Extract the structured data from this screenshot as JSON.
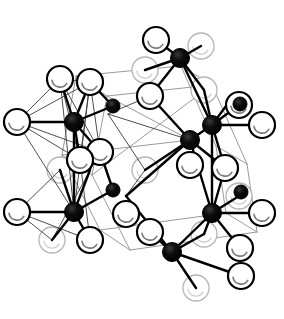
{
  "figure": {
    "background_color": "#ffffff",
    "palette": {
      "open_sphere_fill": "#ffffff",
      "open_sphere_stroke": "#000000",
      "open_sphere_highlight": "#7a7a7a",
      "faint_sphere_stroke": "#b4b4b4",
      "faint_sphere_highlight": "#cccccc",
      "filled_sphere_fill": "#000000",
      "bond_color": "#000000",
      "thin_bond_color": "#3a3a3a",
      "cell_edge_color": "#9a9a9a"
    },
    "geometry": {
      "width": 284,
      "height": 319,
      "open_radius": 13,
      "faint_radius": 13,
      "big_black_radius": 9.5,
      "small_black_radius": 7
    },
    "cell_edges": [
      [
        107,
        96,
        212,
        85
      ],
      [
        107,
        96,
        92,
        175
      ],
      [
        212,
        85,
        247,
        164
      ],
      [
        92,
        175,
        130,
        250
      ],
      [
        247,
        164,
        257,
        232
      ],
      [
        130,
        250,
        257,
        232
      ],
      [
        76,
        76,
        107,
        96
      ],
      [
        181,
        66,
        212,
        85
      ],
      [
        62,
        155,
        92,
        175
      ],
      [
        216,
        146,
        247,
        164
      ],
      [
        76,
        76,
        181,
        66
      ],
      [
        76,
        76,
        62,
        155
      ],
      [
        181,
        66,
        216,
        146
      ],
      [
        62,
        155,
        100,
        230
      ],
      [
        216,
        146,
        226,
        213
      ],
      [
        100,
        230,
        226,
        213
      ],
      [
        100,
        230,
        130,
        250
      ],
      [
        226,
        213,
        257,
        232
      ],
      [
        62,
        155,
        190,
        140
      ],
      [
        107,
        96,
        190,
        140
      ],
      [
        92,
        175,
        212,
        85
      ]
    ],
    "thin_bonds": [
      [
        17,
        122,
        60,
        79
      ],
      [
        17,
        122,
        90,
        82
      ],
      [
        17,
        122,
        80,
        160
      ],
      [
        17,
        122,
        100,
        152
      ],
      [
        60,
        79,
        90,
        82
      ],
      [
        60,
        79,
        80,
        160
      ],
      [
        60,
        79,
        100,
        152
      ],
      [
        90,
        82,
        100,
        152
      ],
      [
        90,
        82,
        80,
        160
      ],
      [
        80,
        160,
        100,
        152
      ],
      [
        60,
        79,
        74,
        212
      ],
      [
        90,
        82,
        74,
        212
      ],
      [
        17,
        122,
        74,
        212
      ],
      [
        100,
        152,
        52,
        240
      ],
      [
        80,
        160,
        90,
        240
      ],
      [
        17,
        212,
        60,
        170
      ],
      [
        17,
        212,
        52,
        240
      ],
      [
        17,
        212,
        90,
        240
      ],
      [
        100,
        152,
        74,
        122
      ],
      [
        80,
        160,
        74,
        122
      ],
      [
        108,
        114,
        190,
        140
      ],
      [
        108,
        114,
        150,
        96
      ],
      [
        150,
        96,
        190,
        140
      ],
      [
        190,
        140,
        145,
        170
      ],
      [
        145,
        170,
        108,
        114
      ],
      [
        190,
        140,
        225,
        168
      ],
      [
        126,
        196,
        190,
        140
      ],
      [
        126,
        196,
        145,
        170
      ],
      [
        156,
        40,
        180,
        58
      ],
      [
        201,
        46,
        180,
        58
      ],
      [
        150,
        96,
        180,
        58
      ],
      [
        204,
        90,
        180,
        58
      ],
      [
        241,
        276,
        172,
        252
      ],
      [
        196,
        288,
        172,
        252
      ],
      [
        150,
        232,
        172,
        252
      ],
      [
        204,
        234,
        172,
        252
      ]
    ],
    "bonds": [
      [
        74,
        122,
        17,
        122
      ],
      [
        74,
        122,
        60,
        79
      ],
      [
        74,
        122,
        90,
        82
      ],
      [
        74,
        122,
        100,
        152
      ],
      [
        74,
        122,
        80,
        160
      ],
      [
        74,
        122,
        113,
        106
      ],
      [
        74,
        122,
        74,
        212
      ],
      [
        74,
        212,
        17,
        212
      ],
      [
        74,
        212,
        60,
        170
      ],
      [
        74,
        212,
        90,
        170
      ],
      [
        74,
        212,
        52,
        240
      ],
      [
        74,
        212,
        90,
        240
      ],
      [
        74,
        212,
        113,
        190
      ],
      [
        180,
        58,
        156,
        40
      ],
      [
        180,
        58,
        201,
        46
      ],
      [
        180,
        58,
        150,
        96
      ],
      [
        180,
        58,
        204,
        90
      ],
      [
        180,
        58,
        145,
        70
      ],
      [
        180,
        58,
        212,
        125
      ],
      [
        212,
        125,
        204,
        90
      ],
      [
        212,
        125,
        239,
        105
      ],
      [
        212,
        125,
        262,
        125
      ],
      [
        212,
        125,
        190,
        140
      ],
      [
        212,
        125,
        225,
        168
      ],
      [
        212,
        125,
        226,
        106
      ],
      [
        212,
        125,
        212,
        213
      ],
      [
        212,
        213,
        262,
        213
      ],
      [
        212,
        213,
        190,
        140
      ],
      [
        212,
        213,
        239,
        196
      ],
      [
        212,
        213,
        225,
        168
      ],
      [
        212,
        213,
        172,
        252
      ],
      [
        212,
        213,
        204,
        234
      ],
      [
        212,
        213,
        240,
        248
      ],
      [
        172,
        252,
        241,
        276
      ],
      [
        172,
        252,
        196,
        288
      ],
      [
        172,
        252,
        150,
        232
      ],
      [
        172,
        252,
        204,
        234
      ],
      [
        172,
        252,
        126,
        196
      ],
      [
        190,
        140,
        150,
        96
      ],
      [
        190,
        140,
        145,
        170
      ],
      [
        190,
        140,
        126,
        196
      ],
      [
        190,
        140,
        225,
        168
      ],
      [
        113,
        106,
        90,
        82
      ],
      [
        113,
        190,
        100,
        152
      ]
    ],
    "faint_spheres": [
      {
        "id": "f1",
        "cx": 201,
        "cy": 46
      },
      {
        "id": "f2",
        "cx": 145,
        "cy": 70
      },
      {
        "id": "f3",
        "cx": 204,
        "cy": 90
      },
      {
        "id": "f4",
        "cx": 145,
        "cy": 170
      },
      {
        "id": "f5",
        "cx": 60,
        "cy": 170
      },
      {
        "id": "f6",
        "cx": 52,
        "cy": 240
      },
      {
        "id": "f7",
        "cx": 239,
        "cy": 196
      },
      {
        "id": "f8",
        "cx": 196,
        "cy": 288
      },
      {
        "id": "f9",
        "cx": 204,
        "cy": 234
      }
    ],
    "open_spheres": [
      {
        "id": "o1",
        "cx": 156,
        "cy": 40
      },
      {
        "id": "o2",
        "cx": 60,
        "cy": 79
      },
      {
        "id": "o3",
        "cx": 90,
        "cy": 82
      },
      {
        "id": "o4",
        "cx": 239,
        "cy": 105
      },
      {
        "id": "o5",
        "cx": 17,
        "cy": 122
      },
      {
        "id": "o6",
        "cx": 150,
        "cy": 96
      },
      {
        "id": "o7",
        "cx": 262,
        "cy": 125
      },
      {
        "id": "o8",
        "cx": 100,
        "cy": 152
      },
      {
        "id": "o9",
        "cx": 80,
        "cy": 160
      },
      {
        "id": "o10",
        "cx": 190,
        "cy": 165
      },
      {
        "id": "o11",
        "cx": 225,
        "cy": 168
      },
      {
        "id": "o12",
        "cx": 17,
        "cy": 212
      },
      {
        "id": "o13",
        "cx": 126,
        "cy": 214
      },
      {
        "id": "o14",
        "cx": 262,
        "cy": 213
      },
      {
        "id": "o15",
        "cx": 150,
        "cy": 232
      },
      {
        "id": "o16",
        "cx": 90,
        "cy": 240
      },
      {
        "id": "o17",
        "cx": 240,
        "cy": 248
      },
      {
        "id": "o18",
        "cx": 241,
        "cy": 276
      }
    ],
    "big_black_spheres": [
      {
        "id": "m1",
        "cx": 180,
        "cy": 58
      },
      {
        "id": "m2",
        "cx": 74,
        "cy": 122
      },
      {
        "id": "m3",
        "cx": 212,
        "cy": 125
      },
      {
        "id": "m4",
        "cx": 190,
        "cy": 140
      },
      {
        "id": "m5",
        "cx": 74,
        "cy": 212
      },
      {
        "id": "m6",
        "cx": 212,
        "cy": 213
      },
      {
        "id": "m7",
        "cx": 172,
        "cy": 252
      }
    ],
    "small_black_spheres": [
      {
        "id": "s1",
        "cx": 113,
        "cy": 106
      },
      {
        "id": "s2",
        "cx": 240,
        "cy": 104
      },
      {
        "id": "s3",
        "cx": 113,
        "cy": 190
      },
      {
        "id": "s4",
        "cx": 241,
        "cy": 192
      }
    ]
  }
}
